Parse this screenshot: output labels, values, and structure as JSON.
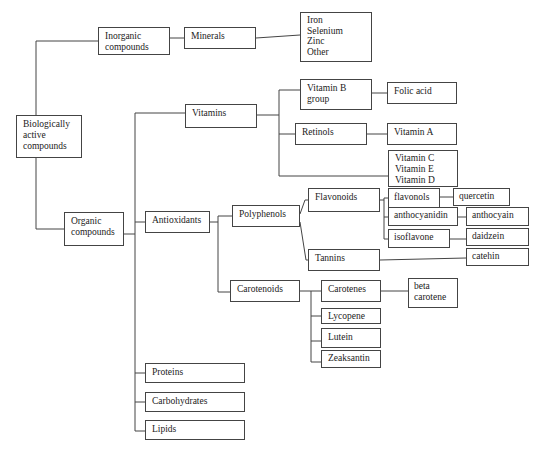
{
  "diagram": {
    "root": "Biologically\nactive\ncompounds",
    "nodes": {
      "inorganic": "Inorganic\ncompounds",
      "minerals": "Minerals",
      "minerals_list": "Iron\nSelenium\nZinc\nOther",
      "organic": "Organic\ncompounds",
      "vitamins": "Vitamins",
      "vitamin_b": "Vitamin B\ngroup",
      "folic_acid": "Folic acid",
      "retinols": "Retinols",
      "vitamin_a": "Vitamin A",
      "vitamin_ced": "Vitamin C\nVitamin E\nVitamin D",
      "antioxidants": "Antioxidants",
      "polyphenols": "Polyphenols",
      "flavonoids": "Flavonoids",
      "flavonols": "flavonols",
      "quercetin": "quercetin",
      "anthocyanidin": "anthocyanidin",
      "anthocyain": "anthocyain",
      "isoflavone": "isoflavone",
      "daidzein": "daidzein",
      "tannins": "Tannins",
      "catehin": "catehin",
      "carotenoids": "Carotenoids",
      "carotenes": "Carotenes",
      "beta_carotene": "beta\ncarotene",
      "lycopene": "Lycopene",
      "lutein": "Lutein",
      "zeaksantin": "Zeaksantin",
      "proteins": "Proteins",
      "carbohydrates": "Carbohydrates",
      "lipids": "Lipids"
    },
    "edges": [
      [
        "root",
        "inorganic"
      ],
      [
        "root",
        "organic"
      ],
      [
        "inorganic",
        "minerals"
      ],
      [
        "minerals",
        "minerals_list"
      ],
      [
        "organic",
        "vitamins"
      ],
      [
        "organic",
        "antioxidants"
      ],
      [
        "organic",
        "proteins"
      ],
      [
        "organic",
        "carbohydrates"
      ],
      [
        "organic",
        "lipids"
      ],
      [
        "vitamins",
        "vitamin_b"
      ],
      [
        "vitamins",
        "retinols"
      ],
      [
        "vitamins",
        "vitamin_ced"
      ],
      [
        "vitamin_b",
        "folic_acid"
      ],
      [
        "retinols",
        "vitamin_a"
      ],
      [
        "antioxidants",
        "polyphenols"
      ],
      [
        "antioxidants",
        "carotenoids"
      ],
      [
        "polyphenols",
        "flavonoids"
      ],
      [
        "polyphenols",
        "tannins"
      ],
      [
        "flavonoids",
        "flavonols"
      ],
      [
        "flavonoids",
        "anthocyanidin"
      ],
      [
        "flavonoids",
        "isoflavone"
      ],
      [
        "flavonols",
        "quercetin"
      ],
      [
        "anthocyanidin",
        "anthocyain"
      ],
      [
        "isoflavone",
        "daidzein"
      ],
      [
        "tannins",
        "catehin"
      ],
      [
        "carotenoids",
        "carotenes"
      ],
      [
        "carotenoids",
        "lycopene"
      ],
      [
        "carotenoids",
        "lutein"
      ],
      [
        "carotenoids",
        "zeaksantin"
      ],
      [
        "carotenes",
        "beta_carotene"
      ]
    ]
  }
}
